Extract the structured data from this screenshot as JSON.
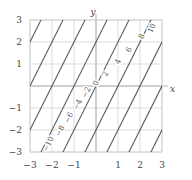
{
  "chart_data": {
    "type": "line",
    "title": "",
    "subtitle": "",
    "xlabel": "x",
    "ylabel": "y",
    "xlim": [
      -3,
      3
    ],
    "ylim": [
      -3,
      3
    ],
    "grid": true,
    "legend": "none",
    "plot_kind": "contour",
    "function": "2x - y",
    "contour_step": 2,
    "xticks": [
      -3,
      -2,
      -1,
      1,
      2,
      3
    ],
    "xtick_labels": [
      "−3",
      "−2",
      "−1",
      "1",
      "2",
      "3"
    ],
    "yticks": [
      3,
      2,
      1,
      -1,
      -2,
      -3
    ],
    "ytick_labels": [
      "3",
      "2",
      "1",
      "−1",
      "−2",
      "−3"
    ],
    "gridlines_x": [
      -3,
      -2,
      -1,
      0,
      1,
      2,
      3
    ],
    "gridlines_y": [
      -3,
      -2,
      -1,
      0,
      1,
      2,
      3
    ],
    "series": [
      {
        "name": "-10",
        "level": -10,
        "label": "−10",
        "label_xy": [
          -2.15,
          -2.65
        ]
      },
      {
        "name": "-8",
        "level": -8,
        "label": "−8",
        "label_xy": [
          -1.62,
          -2.05
        ]
      },
      {
        "name": "-6",
        "level": -6,
        "label": "−6",
        "label_xy": [
          -1.22,
          -1.45
        ]
      },
      {
        "name": "-4",
        "level": -4,
        "label": "−4",
        "label_xy": [
          -0.82,
          -0.85
        ]
      },
      {
        "name": "-2",
        "level": -2,
        "label": "−2",
        "label_xy": [
          -0.42,
          -0.3
        ]
      },
      {
        "name": "0",
        "level": 0,
        "label": "0",
        "label_xy": [
          0.02,
          0.12
        ]
      },
      {
        "name": "2",
        "level": 2,
        "label": "2",
        "label_xy": [
          0.45,
          0.55
        ]
      },
      {
        "name": "4",
        "level": 4,
        "label": "4",
        "label_xy": [
          1.02,
          1.1
        ]
      },
      {
        "name": "6",
        "level": 6,
        "label": "6",
        "label_xy": [
          1.52,
          1.65
        ]
      },
      {
        "name": "8",
        "level": 8,
        "label": "8",
        "label_xy": [
          2.1,
          2.25
        ]
      },
      {
        "name": "10",
        "level": 10,
        "label": "10",
        "label_xy": [
          2.55,
          2.62
        ]
      }
    ],
    "colors": {
      "contour_line": "#555555",
      "grid": "#cccccc",
      "axis": "#aaaaaa",
      "text": "#444444",
      "background": "#ffffff"
    }
  },
  "axes": {
    "x_axis_name": "x",
    "y_axis_name": "y"
  }
}
